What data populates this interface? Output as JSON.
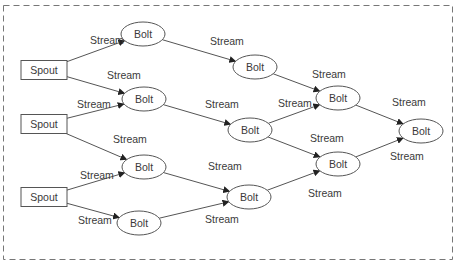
{
  "colors": {
    "stroke": "#555555",
    "text": "#3a3a3a",
    "border": "#777777",
    "background": "#ffffff"
  },
  "nodes": [
    {
      "id": "spout1",
      "type": "spout",
      "label": "Spout",
      "cx": 44,
      "cy": 70
    },
    {
      "id": "spout2",
      "type": "spout",
      "label": "Spout",
      "cx": 44,
      "cy": 124
    },
    {
      "id": "spout3",
      "type": "spout",
      "label": "Spout",
      "cx": 44,
      "cy": 197
    },
    {
      "id": "boltA",
      "type": "bolt",
      "label": "Bolt",
      "cx": 143,
      "cy": 34
    },
    {
      "id": "boltB",
      "type": "bolt",
      "label": "Bolt",
      "cx": 144,
      "cy": 99
    },
    {
      "id": "boltC",
      "type": "bolt",
      "label": "Bolt",
      "cx": 144,
      "cy": 167
    },
    {
      "id": "boltD",
      "type": "bolt",
      "label": "Bolt",
      "cx": 139,
      "cy": 223
    },
    {
      "id": "boltE",
      "type": "bolt",
      "label": "Bolt",
      "cx": 255,
      "cy": 67
    },
    {
      "id": "boltF",
      "type": "bolt",
      "label": "Bolt",
      "cx": 250,
      "cy": 130
    },
    {
      "id": "boltG",
      "type": "bolt",
      "label": "Bolt",
      "cx": 249,
      "cy": 197
    },
    {
      "id": "boltH",
      "type": "bolt",
      "label": "Bolt",
      "cx": 338,
      "cy": 98
    },
    {
      "id": "boltI",
      "type": "bolt",
      "label": "Bolt",
      "cx": 338,
      "cy": 164
    },
    {
      "id": "boltJ",
      "type": "bolt",
      "label": "Bolt",
      "cx": 421,
      "cy": 131
    }
  ],
  "edges": [
    {
      "from": "spout1",
      "to": "boltA",
      "label": "Stream",
      "lx": 90,
      "ly": 44
    },
    {
      "from": "spout1",
      "to": "boltB",
      "label": "Stream",
      "lx": 107,
      "ly": 79
    },
    {
      "from": "spout2",
      "to": "boltB",
      "label": "Stream",
      "lx": 77,
      "ly": 108
    },
    {
      "from": "spout2",
      "to": "boltC",
      "label": "Stream",
      "lx": 113,
      "ly": 143
    },
    {
      "from": "spout3",
      "to": "boltC",
      "label": "Stream",
      "lx": 80,
      "ly": 179
    },
    {
      "from": "spout3",
      "to": "boltD",
      "label": "Stream",
      "lx": 78,
      "ly": 224
    },
    {
      "from": "boltA",
      "to": "boltE",
      "label": "Stream",
      "lx": 210,
      "ly": 45
    },
    {
      "from": "boltB",
      "to": "boltF",
      "label": "Stream",
      "lx": 205,
      "ly": 108
    },
    {
      "from": "boltC",
      "to": "boltG",
      "label": "Stream",
      "lx": 208,
      "ly": 170
    },
    {
      "from": "boltD",
      "to": "boltG",
      "label": "Stream",
      "lx": 205,
      "ly": 223
    },
    {
      "from": "boltE",
      "to": "boltH",
      "label": "Stream",
      "lx": 312,
      "ly": 78
    },
    {
      "from": "boltF",
      "to": "boltH",
      "label": "Stream",
      "lx": 278,
      "ly": 107
    },
    {
      "from": "boltF",
      "to": "boltI",
      "label": "Stream",
      "lx": 310,
      "ly": 142
    },
    {
      "from": "boltG",
      "to": "boltI",
      "label": "Stream",
      "lx": 308,
      "ly": 197
    },
    {
      "from": "boltH",
      "to": "boltJ",
      "label": "Stream",
      "lx": 392,
      "ly": 106
    },
    {
      "from": "boltI",
      "to": "boltJ",
      "label": "Stream",
      "lx": 390,
      "ly": 160
    }
  ]
}
